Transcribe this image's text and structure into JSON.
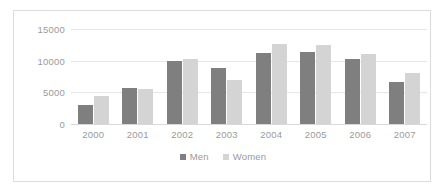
{
  "chart_data": {
    "type": "bar",
    "title": "",
    "subtitle": "",
    "xlabel": "",
    "ylabel": "",
    "categories": [
      "2000",
      "2001",
      "2002",
      "2003",
      "2004",
      "2005",
      "2006",
      "2007"
    ],
    "series": [
      {
        "name": "Men",
        "color": "#7f7f7f",
        "values": [
          3000,
          5700,
          9900,
          8900,
          11200,
          11300,
          10300,
          6700
        ]
      },
      {
        "name": "Women",
        "color": "#d4d4d4",
        "values": [
          4500,
          5500,
          10200,
          7000,
          12600,
          12500,
          11100,
          8000
        ]
      }
    ],
    "ylim": [
      0,
      15000
    ],
    "yticks": [
      0,
      5000,
      10000,
      15000
    ],
    "ytick_labels": [
      "0",
      "5000",
      "10000",
      "15000"
    ],
    "grid": true,
    "grid_axis": "y",
    "legend_position": "bottom",
    "axis_label_color": "#9a9a9a",
    "gridline_color": "#e6e6e6",
    "plot_background": "#ffffff",
    "border_color": "#dcdcdc"
  }
}
